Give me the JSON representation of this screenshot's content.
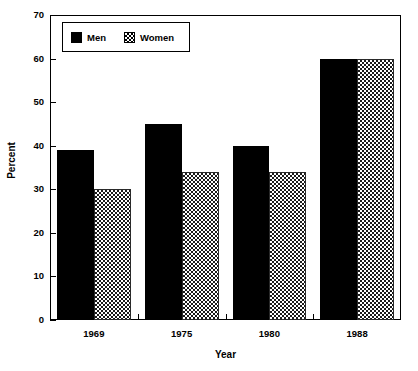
{
  "chart_data": {
    "type": "bar",
    "title": "",
    "subtitle": "",
    "xlabel": "Year",
    "ylabel": "Percent",
    "categories": [
      "1969",
      "1975",
      "1980",
      "1988"
    ],
    "series": [
      {
        "name": "Men",
        "values": [
          39,
          45,
          40,
          60
        ]
      },
      {
        "name": "Women",
        "values": [
          30,
          34,
          34,
          60
        ]
      }
    ],
    "ylim": [
      0,
      70
    ],
    "yticks": [
      0,
      10,
      20,
      30,
      40,
      50,
      60,
      70
    ],
    "ytick_labels": [
      "0",
      "10",
      "20",
      "30",
      "40",
      "50",
      "60",
      "70"
    ],
    "xtick_labels": [
      "1969",
      "1975",
      "1980",
      "1988"
    ],
    "grid": false,
    "legend": {
      "position": "upper-left-inside",
      "entries": [
        {
          "label": "Men",
          "swatch": "solid-black"
        },
        {
          "label": "Women",
          "swatch": "checkered-gray"
        }
      ]
    },
    "colors": {
      "men": "#000000",
      "women": "#808080",
      "axis": "#000000",
      "background": "#ffffff"
    }
  }
}
